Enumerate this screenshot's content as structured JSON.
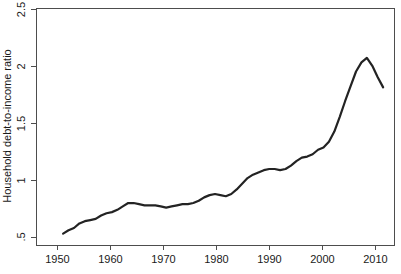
{
  "chart_data": {
    "type": "line",
    "title": "",
    "xlabel": "",
    "ylabel": "Household debt-to-income ratio",
    "xlim": [
      1947,
      2013
    ],
    "ylim": [
      0.43,
      2.52
    ],
    "grid": false,
    "legend": "none",
    "x_ticks": [
      1950,
      1960,
      1970,
      1980,
      1990,
      2000,
      2010
    ],
    "x_tick_labels": [
      "1950",
      "1960",
      "1970",
      "1980",
      "1990",
      "2000",
      "2010"
    ],
    "y_ticks": [
      0.5,
      1,
      1.5,
      2,
      2.5
    ],
    "y_tick_labels": [
      ".5",
      "1",
      "1.5",
      "2",
      "2.5"
    ],
    "series": [
      {
        "name": "Household debt-to-income ratio",
        "color": "#232323",
        "x": [
          1952,
          1953,
          1954,
          1955,
          1956,
          1957,
          1958,
          1959,
          1960,
          1961,
          1962,
          1963,
          1964,
          1965,
          1966,
          1967,
          1968,
          1969,
          1970,
          1971,
          1972,
          1973,
          1974,
          1975,
          1976,
          1977,
          1978,
          1979,
          1980,
          1981,
          1982,
          1983,
          1984,
          1985,
          1986,
          1987,
          1988,
          1989,
          1990,
          1991,
          1992,
          1993,
          1994,
          1995,
          1996,
          1997,
          1998,
          1999,
          2000,
          2001,
          2002,
          2003,
          2004,
          2005,
          2006,
          2007,
          2008,
          2009,
          2010,
          2011
        ],
        "y": [
          0.53,
          0.56,
          0.58,
          0.62,
          0.64,
          0.65,
          0.66,
          0.69,
          0.71,
          0.72,
          0.74,
          0.77,
          0.8,
          0.8,
          0.79,
          0.78,
          0.78,
          0.78,
          0.77,
          0.76,
          0.77,
          0.78,
          0.79,
          0.79,
          0.8,
          0.82,
          0.85,
          0.87,
          0.88,
          0.87,
          0.86,
          0.88,
          0.92,
          0.97,
          1.02,
          1.05,
          1.07,
          1.09,
          1.1,
          1.1,
          1.09,
          1.1,
          1.13,
          1.17,
          1.2,
          1.21,
          1.23,
          1.27,
          1.29,
          1.34,
          1.43,
          1.56,
          1.7,
          1.83,
          1.96,
          2.04,
          2.08,
          2.01,
          1.91,
          1.82
        ]
      }
    ]
  },
  "axis": {
    "y_title": "Household debt-to-income ratio"
  }
}
